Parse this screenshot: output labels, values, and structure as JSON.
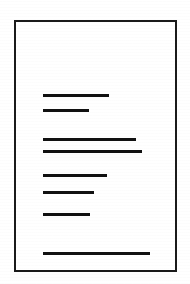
{
  "document": {
    "type": "scanned-page-thumbnail",
    "description": "Black and white scanned document page outline containing redacted horizontal text rules",
    "colors": {
      "page_background": "#ffffff",
      "outer_background": "#ffffff",
      "border_stroke": "#1a1a1a",
      "line_fill": "#111111"
    },
    "page_frame": {
      "left": 14,
      "top": 20,
      "width": 163,
      "height": 252,
      "border_width": 2.5
    },
    "text_lines": [
      {
        "id": "line-1",
        "left": 27,
        "top": 72,
        "width": 66,
        "height": 3
      },
      {
        "id": "line-2",
        "left": 27,
        "top": 87,
        "width": 46,
        "height": 3
      },
      {
        "id": "line-3",
        "left": 27,
        "top": 116,
        "width": 93,
        "height": 3
      },
      {
        "id": "line-4",
        "left": 27,
        "top": 128,
        "width": 99,
        "height": 3
      },
      {
        "id": "line-5",
        "left": 27,
        "top": 152,
        "width": 64,
        "height": 3
      },
      {
        "id": "line-6",
        "left": 27,
        "top": 169,
        "width": 51,
        "height": 3
      },
      {
        "id": "line-7",
        "left": 27,
        "top": 191,
        "width": 47,
        "height": 3
      },
      {
        "id": "line-8",
        "left": 27,
        "top": 230,
        "width": 107,
        "height": 3
      }
    ]
  }
}
